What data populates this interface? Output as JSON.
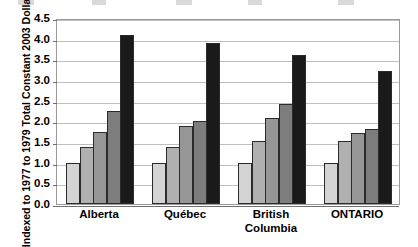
{
  "chart_data": {
    "type": "bar",
    "title": "",
    "subtitle": "",
    "xlabel": "",
    "ylabel_line1": "Constant 2003 Dollars",
    "ylabel_line2": "Indexed to 1977 to 1979 Total",
    "categories": [
      "Alberta",
      "Québec",
      "British Columbia",
      "ONTARIO"
    ],
    "category_lines": [
      [
        "Alberta"
      ],
      [
        "Québec"
      ],
      [
        "British",
        "Columbia"
      ],
      [
        "ONTARIO"
      ]
    ],
    "ylim": [
      0.0,
      4.5
    ],
    "ytick_step": 0.5,
    "ytick_labels": [
      "4.5",
      "4.0",
      "3.5",
      "3.0",
      "2.5",
      "2.0",
      "1.5",
      "1.0",
      "0.5",
      "0.0"
    ],
    "ytick_values": [
      4.5,
      4.0,
      3.5,
      3.0,
      2.5,
      2.0,
      1.5,
      1.0,
      0.5,
      0.0
    ],
    "grid": true,
    "legend": "cropped-off-top",
    "series": [
      {
        "name": "Series 1",
        "color": "#d4d4d4",
        "values": [
          1.0,
          1.0,
          1.0,
          1.0
        ]
      },
      {
        "name": "Series 2",
        "color": "#b0b0b0",
        "values": [
          1.37,
          1.37,
          1.52,
          1.52
        ]
      },
      {
        "name": "Series 3",
        "color": "#969696",
        "values": [
          1.75,
          1.89,
          2.08,
          1.72
        ]
      },
      {
        "name": "Series 4",
        "color": "#7d7d7d",
        "values": [
          2.25,
          2.02,
          2.42,
          1.82
        ]
      },
      {
        "name": "Series 5",
        "color": "#1a1a1a",
        "values": [
          4.1,
          3.9,
          3.6,
          3.22
        ]
      }
    ]
  },
  "legend_remnants": [
    {
      "left": 18,
      "width": 16
    },
    {
      "left": 92,
      "width": 14
    },
    {
      "left": 176,
      "width": 16
    },
    {
      "left": 248,
      "width": 14
    },
    {
      "left": 338,
      "width": 16
    }
  ]
}
